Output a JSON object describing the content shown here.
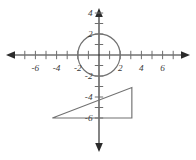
{
  "figure": {
    "width": 196,
    "height": 160,
    "background_color": "#ffffff",
    "axis_color": "#2b2b2b",
    "tick_color": "#6e6e6e",
    "shape_color": "#717171",
    "label_color": "#3a3a3a"
  },
  "chart_data": {
    "type": "scatter",
    "title": "",
    "xlabel": "",
    "ylabel": "",
    "xlim": [
      -8,
      8
    ],
    "ylim": [
      -7.5,
      5
    ],
    "grid": false,
    "legend": null,
    "origin_px": {
      "x": 99,
      "y": 55
    },
    "px_per_unit": {
      "x": 10.6,
      "y": 10.5
    },
    "x_axis": {
      "tick_values": [
        -7,
        -6,
        -5,
        -4,
        -3,
        -2,
        -1,
        1,
        2,
        3,
        4,
        5,
        6,
        7
      ],
      "labeled_ticks": [
        -6,
        -4,
        -2,
        2,
        4,
        6
      ],
      "tick_labels": [
        "-6",
        "-4",
        "-2",
        "2",
        "4",
        "6"
      ],
      "arrows": [
        "left",
        "right"
      ]
    },
    "y_axis": {
      "tick_values": [
        4,
        3,
        2,
        1,
        -1,
        -2,
        -3,
        -4,
        -5,
        -6
      ],
      "labeled_ticks": [
        4,
        2,
        -2,
        -4,
        -6
      ],
      "tick_labels": [
        "4",
        "2",
        "-2",
        "-4",
        "-6"
      ],
      "arrows": [
        "up",
        "down"
      ]
    },
    "shapes": [
      {
        "name": "circle",
        "kind": "circle",
        "center": [
          0,
          0
        ],
        "radius": 2
      },
      {
        "name": "right-triangle",
        "kind": "polygon",
        "vertices": [
          [
            -4.4,
            -6.0
          ],
          [
            3.1,
            -6.0
          ],
          [
            3.1,
            -3.1
          ]
        ]
      }
    ]
  }
}
